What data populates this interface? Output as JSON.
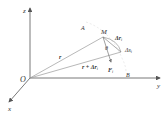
{
  "labels": {
    "z_axis": "z",
    "y_axis": "y",
    "x_axis": "x",
    "origin": "O",
    "point_a": "A",
    "point_m": "M",
    "point_b": "B",
    "vec_r": "r",
    "vec_r_plus": "r + Δr",
    "vec_r_plus_sub": "i",
    "delta_r": "Δr",
    "delta_r_sub": "i",
    "delta_s": "Δs",
    "delta_s_sub": "i",
    "force": "F",
    "force_sub": "i",
    "angle": "θ"
  },
  "colors": {
    "axis": "#555555",
    "vector": "#999999",
    "text": "#333333",
    "dashed": "#cccccc"
  }
}
